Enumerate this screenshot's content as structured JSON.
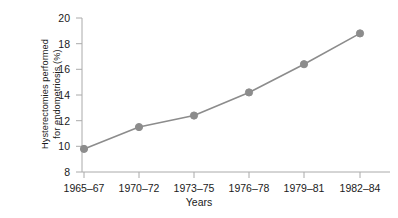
{
  "chart_data": {
    "type": "line",
    "title": "",
    "xlabel": "Years",
    "ylabel_line1": "Hysterectomies performed",
    "ylabel_line2": "for endometriosis (%)",
    "ylabel": "Hysterectomies performed for endometriosis (%)",
    "categories": [
      "1965–67",
      "1970–72",
      "1973–75",
      "1976–78",
      "1979–81",
      "1982–84"
    ],
    "values": [
      9.8,
      11.5,
      12.4,
      14.2,
      16.4,
      18.8
    ],
    "series": [
      {
        "name": "Hysterectomies performed for endometriosis (%)",
        "values": [
          9.8,
          11.5,
          12.4,
          14.2,
          16.4,
          18.8
        ]
      }
    ],
    "ylim": [
      8,
      20
    ],
    "yticks": [
      8,
      10,
      12,
      14,
      16,
      18,
      20
    ],
    "ytick_labels": [
      "8",
      "10",
      "12",
      "14",
      "16",
      "18",
      "20"
    ],
    "grid": false,
    "legend": false,
    "legend_position": "none",
    "line_color": "#8c8c8c",
    "marker_color": "#8c8c8c",
    "marker_shape": "circle",
    "axis_color": "#aaaaaa",
    "background_color": "#ffffff"
  }
}
